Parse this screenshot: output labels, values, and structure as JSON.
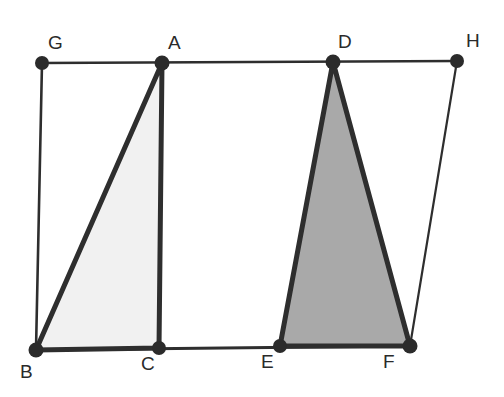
{
  "figure": {
    "background_color": "#ffffff",
    "stroke_color": "#2e2e2e",
    "vertex_dot_color": "#2b2b2b",
    "triangle_abc_fill": "#f1f1f1",
    "triangle_def_fill": "#a9a9a9"
  },
  "labels": {
    "g": "G",
    "a": "A",
    "d": "D",
    "h": "H",
    "b": "B",
    "c": "C",
    "e": "E",
    "f": "F"
  },
  "geometry": {
    "points": {
      "G": {
        "x": 42,
        "y": 63,
        "label": "G"
      },
      "A": {
        "x": 162,
        "y": 63,
        "label": "A"
      },
      "D": {
        "x": 333,
        "y": 62,
        "label": "D"
      },
      "H": {
        "x": 457,
        "y": 61,
        "label": "H"
      },
      "B": {
        "x": 36,
        "y": 350,
        "label": "B"
      },
      "C": {
        "x": 159,
        "y": 348,
        "label": "C"
      },
      "E": {
        "x": 280,
        "y": 346,
        "label": "E"
      },
      "F": {
        "x": 410,
        "y": 346,
        "label": "F"
      }
    },
    "label_positions": {
      "G": {
        "x": 48,
        "y": 33
      },
      "A": {
        "x": 168,
        "y": 33
      },
      "D": {
        "x": 338,
        "y": 32
      },
      "H": {
        "x": 466,
        "y": 31
      },
      "B": {
        "x": 20,
        "y": 362
      },
      "C": {
        "x": 141,
        "y": 354
      },
      "E": {
        "x": 261,
        "y": 352
      },
      "F": {
        "x": 383,
        "y": 352
      }
    },
    "segments": [
      {
        "name": "top-line-GH",
        "from": "G",
        "to": "H",
        "weight": "thin"
      },
      {
        "name": "bottom-line-BF",
        "from": "B",
        "to": "F",
        "weight": "medium"
      },
      {
        "name": "side-GB",
        "from": "G",
        "to": "B",
        "weight": "thin"
      },
      {
        "name": "side-HF",
        "from": "H",
        "to": "F",
        "weight": "thin"
      }
    ],
    "triangles": [
      {
        "name": "triangle-ABC",
        "vertices": [
          "A",
          "B",
          "C"
        ],
        "fill": "#f1f1f1",
        "shade": "light"
      },
      {
        "name": "triangle-DEF",
        "vertices": [
          "D",
          "E",
          "F"
        ],
        "fill": "#a9a9a9",
        "shade": "dark"
      }
    ]
  }
}
